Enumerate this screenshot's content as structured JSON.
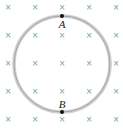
{
  "diagram": {
    "field_symbol": "×",
    "field_color": "#6aa596",
    "loop_color": "#c8c8c8",
    "grid": {
      "cols_x": [
        8,
        35,
        62,
        89,
        116
      ],
      "rows_y": [
        7,
        35,
        63,
        91,
        119
      ]
    },
    "loop": {
      "cx": 62,
      "cy": 64,
      "r": 48
    },
    "points": [
      {
        "label": "A",
        "x": 62,
        "y": 16
      },
      {
        "label": "B",
        "x": 62,
        "y": 112
      }
    ]
  }
}
